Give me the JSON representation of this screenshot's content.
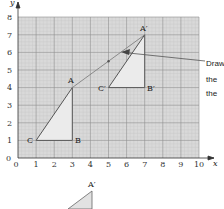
{
  "diagram": {
    "grid": {
      "x_min": 0,
      "x_max": 10,
      "y_min": 0,
      "y_max": 8,
      "background": "#d9d9d9",
      "line_color": "#9a9a9a"
    },
    "axes": {
      "x_label": "x",
      "y_label": "y",
      "x_ticks": [
        "0",
        "1",
        "2",
        "3",
        "4",
        "5",
        "6",
        "7",
        "8",
        "9",
        "10"
      ],
      "y_ticks": [
        "0",
        "1",
        "2",
        "3",
        "4",
        "5",
        "6",
        "7",
        "8"
      ]
    },
    "triangle_original": {
      "A": [
        3,
        4
      ],
      "B": [
        3,
        1
      ],
      "C": [
        1,
        1
      ],
      "labels": {
        "A": "A",
        "B": "B",
        "C": "C"
      }
    },
    "triangle_image": {
      "A": [
        7,
        7
      ],
      "B": [
        7,
        4
      ],
      "C": [
        5,
        4
      ],
      "labels": {
        "A": "A′",
        "B": "B′",
        "C": "C′"
      }
    },
    "translation_line": {
      "from": [
        3,
        4
      ],
      "to": [
        7,
        7
      ],
      "midpoint_marker": [
        5,
        5.5
      ]
    },
    "arrow_marker": [
      6.1,
      6
    ],
    "annotation": {
      "lines": [
        "Draw",
        "the",
        "the"
      ]
    },
    "partial_figure": {
      "label": "A′"
    }
  }
}
